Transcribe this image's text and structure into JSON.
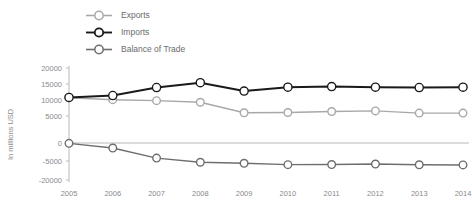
{
  "chart_data": {
    "type": "line",
    "title": "",
    "subtitle": "",
    "xlabel": "",
    "ylabel": "In millions USD",
    "x": [
      2005,
      2006,
      2007,
      2008,
      2009,
      2010,
      2011,
      2012,
      2013,
      2014
    ],
    "categories": [
      "2005",
      "2006",
      "2007",
      "2008",
      "2009",
      "2010",
      "2011",
      "2012",
      "2013",
      "2014"
    ],
    "ytick_labels": [
      "20000",
      "15000",
      "10000",
      "5000",
      "0",
      "-5000",
      "-20000"
    ],
    "ytick_values": [
      20000,
      15000,
      10000,
      5000,
      0,
      -5000,
      -20000
    ],
    "ylim": [
      -20000,
      20000
    ],
    "grid": false,
    "legend_position": "top-left",
    "series": [
      {
        "name": "Exports",
        "color": "#a8a8a8",
        "marker": "circle-open",
        "values": [
          10700,
          10100,
          9800,
          9300,
          6000,
          6100,
          6400,
          6600,
          5900,
          5900
        ]
      },
      {
        "name": "Imports",
        "color": "#1a1a1a",
        "marker": "circle-open",
        "values": [
          10800,
          11400,
          13900,
          15400,
          12800,
          14000,
          14200,
          14000,
          13900,
          14000
        ]
      },
      {
        "name": "Balance of Trade",
        "color": "#6e6e6e",
        "marker": "circle-open",
        "values": [
          -100,
          -1400,
          -4200,
          -6000,
          -6800,
          -7900,
          -7800,
          -7400,
          -8000,
          -8100
        ]
      }
    ]
  },
  "legend": {
    "items": [
      {
        "label": "Exports",
        "color": "#a8a8a8"
      },
      {
        "label": "Imports",
        "color": "#1a1a1a"
      },
      {
        "label": "Balance of Trade",
        "color": "#6e6e6e"
      }
    ]
  },
  "axis": {
    "y_title": "In millions USD"
  }
}
